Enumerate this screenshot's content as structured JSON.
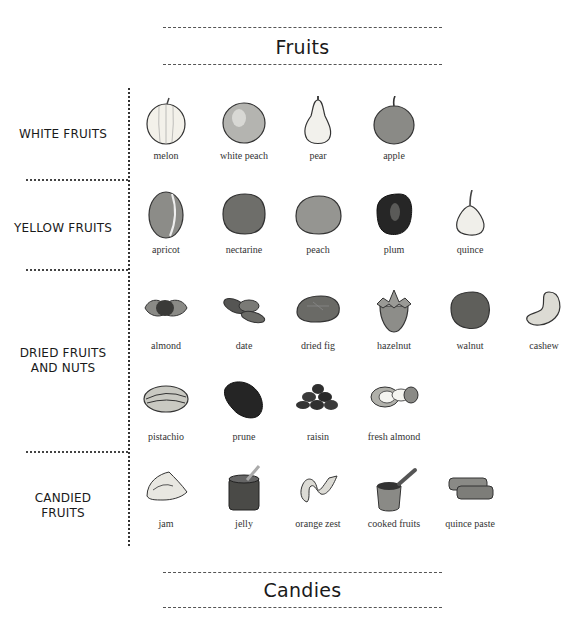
{
  "sections": {
    "fruits_title": "Fruits",
    "candies_title": "Candies"
  },
  "categories": [
    {
      "label": "WHITE FRUITS",
      "items": [
        {
          "name": "melon",
          "icon": "melon-icon",
          "color": "#f3f1ea"
        },
        {
          "name": "white peach",
          "icon": "white-peach-icon",
          "color": "#b4b4b0"
        },
        {
          "name": "pear",
          "icon": "pear-icon",
          "color": "#f2f1ec"
        },
        {
          "name": "apple",
          "icon": "apple-icon",
          "color": "#8a8a86"
        }
      ]
    },
    {
      "label": "YELLOW FRUITS",
      "items": [
        {
          "name": "apricot",
          "icon": "apricot-icon",
          "color": "#8c8c88"
        },
        {
          "name": "nectarine",
          "icon": "nectarine-icon",
          "color": "#6e6e6a"
        },
        {
          "name": "peach",
          "icon": "peach-icon",
          "color": "#959591"
        },
        {
          "name": "plum",
          "icon": "plum-icon",
          "color": "#262626"
        },
        {
          "name": "quince",
          "icon": "quince-icon",
          "color": "#f0efea"
        }
      ]
    },
    {
      "label_line1": "DRIED FRUITS",
      "label_line2": "AND NUTS",
      "items": [
        {
          "name": "almond",
          "icon": "almond-icon",
          "color": "#555553"
        },
        {
          "name": "date",
          "icon": "date-icon",
          "color": "#6b6b67"
        },
        {
          "name": "dried fig",
          "icon": "dried-fig-icon",
          "color": "#6a6a66"
        },
        {
          "name": "hazelnut",
          "icon": "hazelnut-icon",
          "color": "#8d8d89"
        },
        {
          "name": "walnut",
          "icon": "walnut-icon",
          "color": "#5f5f5b"
        },
        {
          "name": "cashew",
          "icon": "cashew-icon",
          "color": "#dcdbd4"
        },
        {
          "name": "pistachio",
          "icon": "pistachio-icon",
          "color": "#c9c9c2"
        },
        {
          "name": "prune",
          "icon": "prune-icon",
          "color": "#252525"
        },
        {
          "name": "raisin",
          "icon": "raisin-icon",
          "color": "#2f2f2f"
        },
        {
          "name": "fresh almond",
          "icon": "fresh-almond-icon",
          "color": "#b0b0aa"
        }
      ]
    },
    {
      "label_line1": "CANDIED",
      "label_line2": "FRUITS",
      "items": [
        {
          "name": "jam",
          "icon": "jam-icon",
          "color": "#e8e7e1"
        },
        {
          "name": "jelly",
          "icon": "jelly-icon",
          "color": "#4a4a47"
        },
        {
          "name": "orange zest",
          "icon": "orange-zest-icon",
          "color": "#dcdbd5"
        },
        {
          "name": "cooked fruits",
          "icon": "cooked-fruits-icon",
          "color": "#8a8a86"
        },
        {
          "name": "quince paste",
          "icon": "quince-paste-icon",
          "color": "#7d7d79"
        }
      ]
    }
  ]
}
